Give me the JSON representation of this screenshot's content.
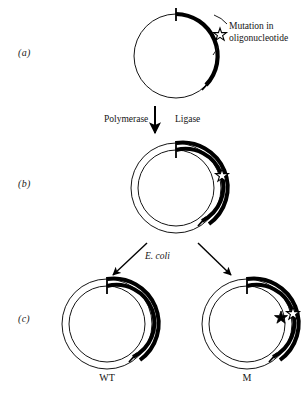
{
  "figure": {
    "background_color": "#ffffff",
    "ink_color": "#0a0a0a",
    "width": 307,
    "height": 398
  },
  "panels": [
    {
      "id": "a",
      "label": "(a)"
    },
    {
      "id": "b",
      "label": "(b)"
    },
    {
      "id": "c",
      "label": "(c)"
    }
  ],
  "annotations": {
    "mutation_callout_line1": "Mutation in",
    "mutation_callout_line2": "oligonucleotide",
    "polymerase_label": "Polymerase",
    "ligase_label": "Ligase",
    "ecoli_label": "E. coli"
  },
  "products": [
    {
      "id": "wt",
      "label": "WT"
    },
    {
      "id": "m",
      "label": "M"
    }
  ],
  "icons": {
    "star_outline": "star-outline-icon",
    "star_filled": "star-filled-icon",
    "down_arrow": "down-arrow-icon",
    "branch_arrow_left": "branch-arrow-left-icon",
    "branch_arrow_right": "branch-arrow-right-icon"
  }
}
